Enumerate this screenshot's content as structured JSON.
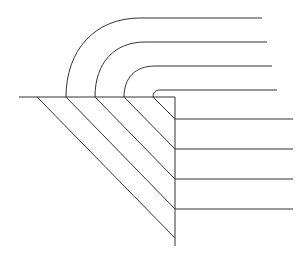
{
  "diagram": {
    "title": "",
    "stroke_color": "#333333",
    "background_color": "#ffffff",
    "layers": [
      {
        "id": "layer-1",
        "label": ""
      },
      {
        "id": "layer-2",
        "label": ""
      },
      {
        "id": "layer-3",
        "label": ""
      },
      {
        "id": "layer-4",
        "label": ""
      }
    ],
    "labels": []
  }
}
